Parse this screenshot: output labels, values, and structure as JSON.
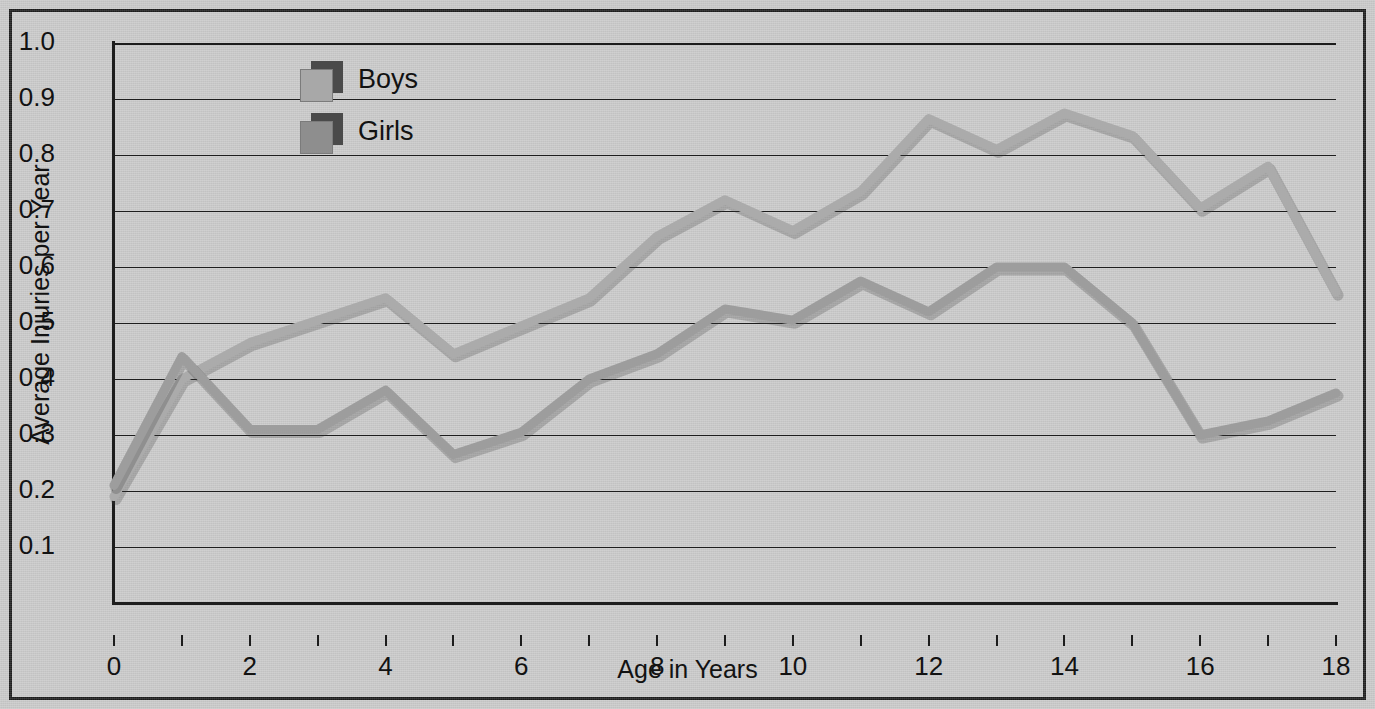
{
  "chart_data": {
    "type": "line",
    "title": "",
    "xlabel": "Age in Years",
    "ylabel": "Average Injuries per Year",
    "x": [
      0,
      1,
      2,
      3,
      4,
      5,
      6,
      7,
      8,
      9,
      10,
      11,
      12,
      13,
      14,
      15,
      16,
      17,
      18
    ],
    "xlim": [
      0,
      18
    ],
    "ylim": [
      0,
      1.0
    ],
    "xticks": [
      0,
      2,
      4,
      6,
      8,
      10,
      12,
      14,
      16,
      18
    ],
    "xtick_labels": [
      "0",
      "2",
      "4",
      "6",
      "8",
      "10",
      "12",
      "14",
      "16",
      "18"
    ],
    "xminor_ticks": [
      1,
      3,
      5,
      7,
      9,
      11,
      13,
      15,
      17
    ],
    "yticks": [
      0.1,
      0.2,
      0.3,
      0.4,
      0.5,
      0.6,
      0.7,
      0.8,
      0.9,
      1.0
    ],
    "ytick_labels": [
      "0.1",
      "0.2",
      "0.3",
      "0.4",
      "0.5",
      "0.6",
      "0.7",
      "0.8",
      "0.9",
      "1.0"
    ],
    "grid": true,
    "grid_axis": "y",
    "legend_position": "top-left-inset",
    "series": [
      {
        "name": "Boys",
        "color": "#9a9a9a",
        "values": [
          0.21,
          0.44,
          0.31,
          0.31,
          0.38,
          0.265,
          0.305,
          0.4,
          0.445,
          0.525,
          0.505,
          0.575,
          0.52,
          0.6,
          0.6,
          0.5,
          0.3,
          0.325,
          0.375
        ]
      },
      {
        "name": "Girls",
        "color": "#a8a8a8",
        "values": [
          0.19,
          0.4,
          0.465,
          0.505,
          0.545,
          0.445,
          0.495,
          0.545,
          0.655,
          0.72,
          0.665,
          0.735,
          0.865,
          0.81,
          0.875,
          0.835,
          0.705,
          0.78,
          0.555
        ]
      }
    ]
  },
  "legend": {
    "items": [
      {
        "label": "Boys",
        "swatch_color": "#a8a8a8",
        "shadow_color": "#4a4a4a"
      },
      {
        "label": "Girls",
        "swatch_color": "#8e8e8e",
        "shadow_color": "#4a4a4a"
      }
    ]
  },
  "colors": {
    "background": "#c9c9c9",
    "frame": "#1d1d1d",
    "axis": "#1d1d1d",
    "grid": "#1d1d1d",
    "text": "#121212",
    "boys_line": "#9d9d9d",
    "girls_line": "#ababab"
  }
}
